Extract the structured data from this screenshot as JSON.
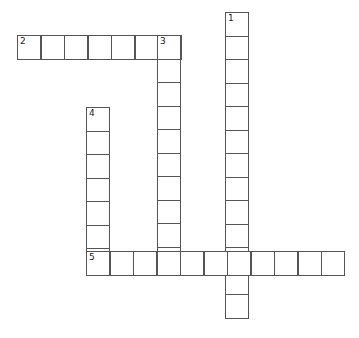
{
  "puzzle": {
    "type": "crossword",
    "cell_size_px": 23.5,
    "words": [
      {
        "number": "1",
        "direction": "down",
        "length": 13,
        "start": {
          "x": 225,
          "y": 12
        }
      },
      {
        "number": "2",
        "direction": "across",
        "length": 7,
        "start": {
          "x": 17,
          "y": 35
        }
      },
      {
        "number": "3",
        "direction": "down",
        "length": 10,
        "start": {
          "x": 157,
          "y": 35
        }
      },
      {
        "number": "4",
        "direction": "down",
        "length": 7,
        "start": {
          "x": 86,
          "y": 107
        }
      },
      {
        "number": "5",
        "direction": "across",
        "length": 11,
        "start": {
          "x": 86,
          "y": 251
        }
      }
    ],
    "colors": {
      "border": "#555555",
      "background": "#ffffff",
      "number_text": "#222222"
    }
  }
}
